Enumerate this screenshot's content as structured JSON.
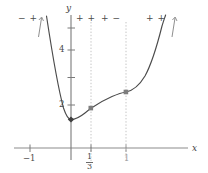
{
  "figure": {
    "kind": "cartesian-graph",
    "axes": {
      "x_label": "x",
      "y_label": "y",
      "x_ticks": [
        {
          "value": -1,
          "label": "−1"
        },
        {
          "value": 0.3333,
          "label_num": "1",
          "label_den": "3"
        },
        {
          "value": 1,
          "label": "1"
        }
      ],
      "y_ticks": [
        {
          "value": 2,
          "label": "2"
        },
        {
          "value": 3,
          "label": ""
        },
        {
          "value": 4,
          "label": "4"
        },
        {
          "value": 5,
          "label": ""
        }
      ]
    },
    "sign_intervals": [
      {
        "id": "left-of-origin",
        "text": "− +",
        "arrow": "up"
      },
      {
        "id": "origin-to-third",
        "text": "+ +",
        "arrow": "none"
      },
      {
        "id": "third-to-one",
        "text": "+ −",
        "arrow": "none"
      },
      {
        "id": "right-of-one",
        "text": "+ +",
        "arrow": "up"
      }
    ],
    "dashed_lines": [
      {
        "id": "vline-one-third",
        "x": 0.3333
      },
      {
        "id": "vline-one",
        "x": 1
      }
    ],
    "marked_points": [
      {
        "id": "minimum-point",
        "x": 0,
        "y": 1,
        "style": "filled-diamond"
      },
      {
        "id": "inflection-point-one-third",
        "x": 0.3333,
        "y": 1.55,
        "style": "filled-square"
      },
      {
        "id": "inflection-point-one",
        "x": 1,
        "y": 2.0,
        "style": "filled-square"
      }
    ],
    "colors": {
      "curve": "#4b4b4b",
      "axis": "#6e6e6e",
      "dashed": "#bdbdbd",
      "text": "#4a4a4a",
      "point": "#5a5a5a",
      "arrow": "#8a8a8a"
    }
  }
}
